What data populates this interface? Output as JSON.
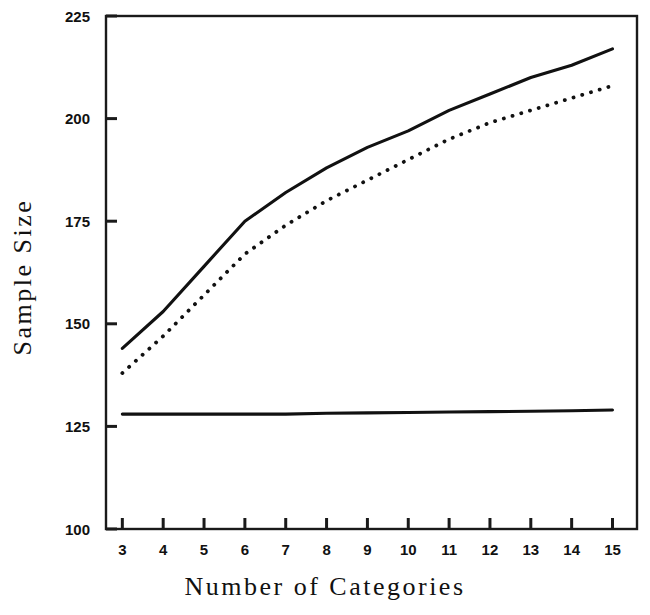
{
  "chart_data": {
    "type": "line",
    "title": "",
    "xlabel": "Number of Categories",
    "ylabel": "Sample Size",
    "x": [
      3,
      4,
      5,
      6,
      7,
      8,
      9,
      10,
      11,
      12,
      13,
      14,
      15
    ],
    "xlim": [
      2.6,
      15.6
    ],
    "ylim": [
      100,
      225
    ],
    "xticks": [
      3,
      4,
      5,
      6,
      7,
      8,
      9,
      10,
      11,
      12,
      13,
      14,
      15
    ],
    "xticklabels": [
      "3",
      "4",
      "5",
      "6",
      "7",
      "8",
      "9",
      "10",
      "11",
      "12",
      "13",
      "14",
      "15"
    ],
    "yticks": [
      100,
      125,
      150,
      175,
      200,
      225
    ],
    "yticklabels": [
      "100",
      "125",
      "150",
      "175",
      "200",
      "225"
    ],
    "grid": false,
    "legend": "none",
    "frame": "box",
    "series": [
      {
        "name": "upper-solid-curve",
        "style": "solid",
        "color": "#111111",
        "values": [
          144,
          153,
          164,
          175,
          182,
          188,
          193,
          197,
          202,
          206,
          210,
          213,
          217
        ]
      },
      {
        "name": "middle-dotted-curve",
        "style": "dotted",
        "color": "#111111",
        "values": [
          138,
          147,
          157,
          167,
          174,
          180,
          185,
          190,
          195,
          199,
          202,
          205,
          208
        ]
      },
      {
        "name": "lower-flat-line",
        "style": "solid",
        "color": "#111111",
        "values": [
          128,
          128,
          128,
          128,
          128,
          128.2,
          128.3,
          128.4,
          128.5,
          128.6,
          128.7,
          128.8,
          129
        ]
      }
    ]
  },
  "axes": {
    "y_title": "Sample Size",
    "x_title": "Number of Categories"
  }
}
